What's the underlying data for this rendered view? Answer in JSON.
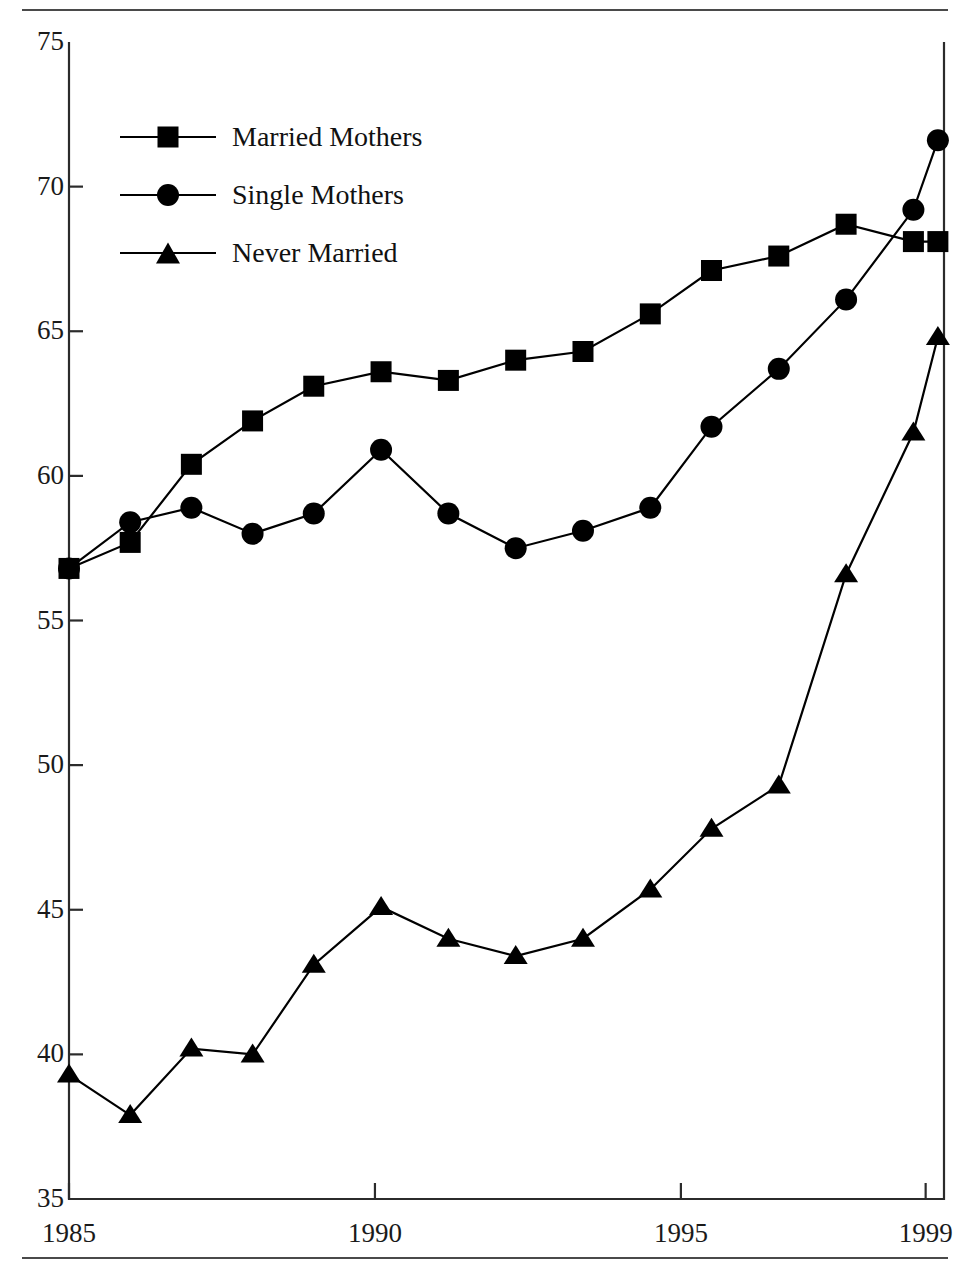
{
  "figure": {
    "background": "#ffffff",
    "ink_color": "#000000",
    "rule_color": "#4a4a4a"
  },
  "legend": {
    "position": "inside-top-left",
    "entries": [
      {
        "label": "Married Mothers",
        "marker": "square-marker-icon"
      },
      {
        "label": "Single Mothers",
        "marker": "circle-marker-icon"
      },
      {
        "label": "Never Married",
        "marker": "triangle-marker-icon"
      }
    ]
  },
  "axes": {
    "y_ticks": [
      "75",
      "70",
      "65",
      "60",
      "55",
      "50",
      "45",
      "40",
      "35"
    ],
    "x_ticks": [
      "1985",
      "1990",
      "1995",
      "1999"
    ]
  },
  "chart_data": {
    "type": "line",
    "title": "",
    "subtitle": "",
    "xlabel": "",
    "ylabel": "",
    "xlim": [
      1985,
      1999.3
    ],
    "ylim": [
      35,
      75
    ],
    "yticks": [
      35,
      40,
      45,
      50,
      55,
      60,
      65,
      70,
      75
    ],
    "xticks": [
      1985,
      1990,
      1995,
      1999
    ],
    "grid": false,
    "legend_position": "upper left (inside plot)",
    "x": [
      1985,
      1986,
      1987,
      1988,
      1989,
      1990.1,
      1991.2,
      1992.3,
      1993.4,
      1994.5,
      1995.5,
      1996.6,
      1997.7,
      1998.8,
      1999.2
    ],
    "series": [
      {
        "name": "Married Mothers",
        "marker": "square",
        "values": [
          56.8,
          57.7,
          60.4,
          61.9,
          63.1,
          63.6,
          63.3,
          64.0,
          64.3,
          65.6,
          67.1,
          67.6,
          68.7,
          68.1,
          68.1
        ]
      },
      {
        "name": "Single Mothers",
        "marker": "circle",
        "values": [
          56.8,
          58.4,
          58.9,
          58.0,
          58.7,
          60.9,
          58.7,
          57.5,
          58.1,
          58.9,
          61.7,
          63.7,
          66.1,
          69.2,
          71.6
        ]
      },
      {
        "name": "Never Married",
        "marker": "triangle",
        "values": [
          39.3,
          37.9,
          40.2,
          40.0,
          43.1,
          45.1,
          44.0,
          43.4,
          44.0,
          45.7,
          47.8,
          49.3,
          56.6,
          61.5,
          64.8
        ]
      }
    ]
  },
  "footnote": {
    "text": ""
  }
}
